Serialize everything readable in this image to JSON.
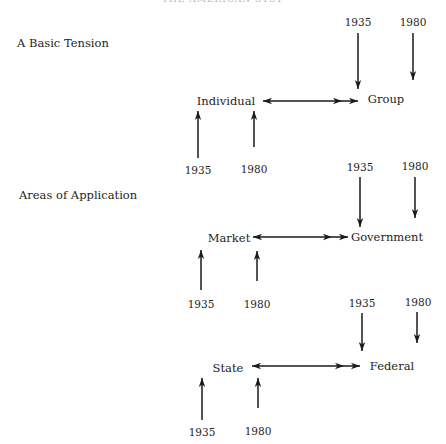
{
  "header": {
    "cut_off_text": "THE AMERICAN SYSTEM"
  },
  "sections": [
    {
      "title": "A Basic Tension",
      "title_pos": [
        17,
        46
      ],
      "left_node": {
        "label": "Individual",
        "x": 226,
        "y": 101
      },
      "right_node": {
        "label": "Group",
        "x": 386,
        "y": 99
      },
      "link": {
        "x1": 263,
        "x2": 358,
        "y": 101
      },
      "top_years": [
        {
          "label": "1935",
          "x": 358,
          "y": 22,
          "arrow": {
            "x": 358,
            "y1": 33,
            "y2": 89
          }
        },
        {
          "label": "1980",
          "x": 413,
          "y": 22,
          "arrow": {
            "x": 413,
            "y1": 33,
            "y2": 80
          }
        }
      ],
      "bottom_years": [
        {
          "label": "1935",
          "x": 198,
          "y": 170,
          "arrow": {
            "x": 198,
            "y1": 158,
            "y2": 111
          }
        },
        {
          "label": "1980",
          "x": 254,
          "y": 169,
          "arrow": {
            "x": 254,
            "y1": 147,
            "y2": 111
          }
        }
      ]
    },
    {
      "title": "Areas of Application",
      "title_pos": [
        19,
        198
      ],
      "left_node": {
        "label": "Market",
        "x": 229,
        "y": 238
      },
      "right_node": {
        "label": "Government",
        "x": 387,
        "y": 237
      },
      "link": {
        "x1": 253,
        "x2": 348,
        "y": 237
      },
      "top_years": [
        {
          "label": "1935",
          "x": 360,
          "y": 167,
          "arrow": {
            "x": 360,
            "y1": 177,
            "y2": 227
          }
        },
        {
          "label": "1980",
          "x": 415,
          "y": 166,
          "arrow": {
            "x": 415,
            "y1": 177,
            "y2": 218
          }
        }
      ],
      "bottom_years": [
        {
          "label": "1935",
          "x": 201,
          "y": 304,
          "arrow": {
            "x": 201,
            "y1": 290,
            "y2": 250
          }
        },
        {
          "label": "1980",
          "x": 257,
          "y": 304,
          "arrow": {
            "x": 257,
            "y1": 281,
            "y2": 251
          }
        }
      ]
    },
    {
      "title": "",
      "title_pos": [
        0,
        0
      ],
      "left_node": {
        "label": "State",
        "x": 228,
        "y": 368
      },
      "right_node": {
        "label": "Federal",
        "x": 392,
        "y": 366
      },
      "link": {
        "x1": 252,
        "x2": 360,
        "y": 366
      },
      "top_years": [
        {
          "label": "1935",
          "x": 362,
          "y": 303,
          "arrow": {
            "x": 362,
            "y1": 313,
            "y2": 351
          }
        },
        {
          "label": "1980",
          "x": 418,
          "y": 302,
          "arrow": {
            "x": 417,
            "y1": 312,
            "y2": 343
          }
        }
      ],
      "bottom_years": [
        {
          "label": "1935",
          "x": 202,
          "y": 432,
          "arrow": {
            "x": 202,
            "y1": 420,
            "y2": 378
          }
        },
        {
          "label": "1980",
          "x": 258,
          "y": 431,
          "arrow": {
            "x": 258,
            "y1": 408,
            "y2": 378
          }
        }
      ]
    }
  ],
  "colors": {
    "ink": "#1a1a1a",
    "background": "#ffffff"
  }
}
